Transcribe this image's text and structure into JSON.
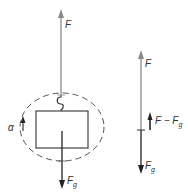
{
  "diagram": {
    "colors": {
      "force_F": "#8a8a8a",
      "force_Fg": "#222222",
      "net_force": "#222222",
      "outline": "#444444",
      "dashed_system": "#555555",
      "text": "#333333"
    },
    "left_figure": {
      "applied_force": {
        "label": "F",
        "direction": "up"
      },
      "gravity_force": {
        "label": "F",
        "subscript": "g",
        "direction": "down"
      },
      "acceleration": {
        "label": "α",
        "direction": "up"
      },
      "system_boundary": "dashed ellipse",
      "object": "block with hook"
    },
    "right_figure": {
      "applied_force": {
        "label": "F",
        "direction": "up"
      },
      "net_force": {
        "label": "F − F",
        "subscript": "g",
        "direction": "up"
      },
      "gravity_force": {
        "label": "F",
        "subscript": "g",
        "direction": "down"
      }
    }
  }
}
